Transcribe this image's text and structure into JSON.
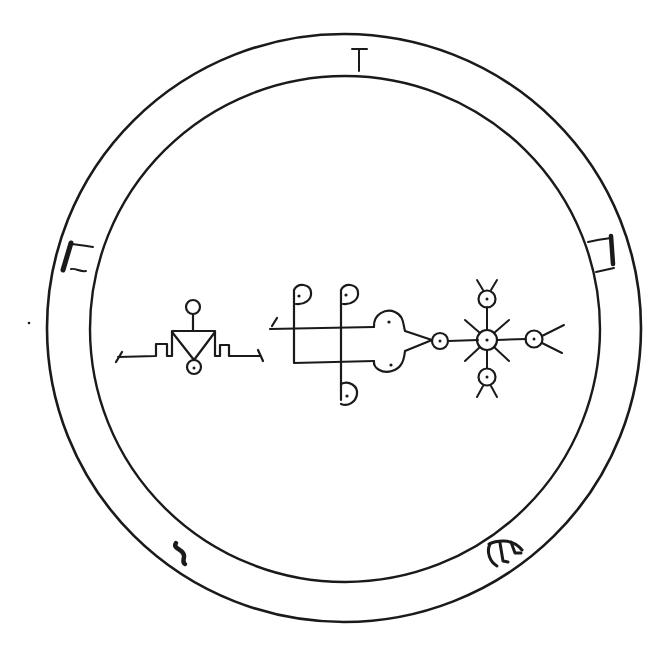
{
  "colors": {
    "background": "#ffffff",
    "ink": "#1a1a1a"
  },
  "ring": {
    "outer_circle": {
      "cx": 344,
      "cy": 328,
      "r": 296
    },
    "inner_circle": {
      "cx": 345,
      "cy": 329,
      "r": 254
    },
    "glyphs": [
      {
        "id": "top",
        "position": "top",
        "glyph": "T-shaped mark",
        "x": 359,
        "y": 60
      },
      {
        "id": "right",
        "position": "right",
        "glyph": "bracket-shaped mark with heavy right stroke",
        "x": 609,
        "y": 253
      },
      {
        "id": "left",
        "position": "left",
        "glyph": "bracket-shaped mark with heavy left stroke",
        "x": 75,
        "y": 258
      },
      {
        "id": "bottom-left",
        "position": "bottom-left",
        "glyph": "S-shaped stroke",
        "x": 181,
        "y": 550
      },
      {
        "id": "bottom-right",
        "position": "bottom-right",
        "glyph": "three-legged arch mark",
        "x": 508,
        "y": 551
      }
    ]
  },
  "sigil": {
    "left_figure": "stepped platform with inverted triangle, small circle above and dotted circle below",
    "middle_figure": "crossed bars with three hooked dotted terminals and trefoil arrow pointing right",
    "right_figure": "radiating star of dotted circles with forked ends"
  }
}
